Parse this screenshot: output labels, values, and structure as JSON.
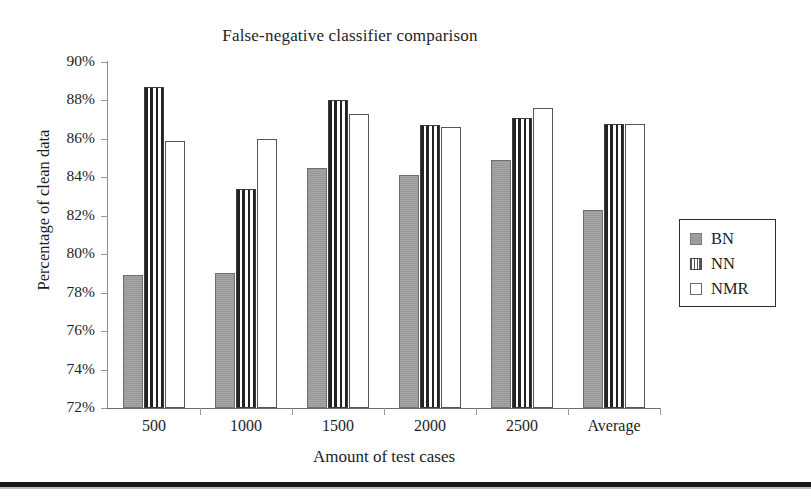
{
  "chart_data": {
    "type": "bar",
    "title": "False-negative classifier comparison",
    "xlabel": "Amount of test cases",
    "ylabel": "Percentage of clean data",
    "categories": [
      "500",
      "1000",
      "1500",
      "2000",
      "2500",
      "Average"
    ],
    "series": [
      {
        "name": "BN",
        "values": [
          78.9,
          79.0,
          84.5,
          84.1,
          84.9,
          82.3
        ]
      },
      {
        "name": "NN",
        "values": [
          88.7,
          83.4,
          88.0,
          86.7,
          87.1,
          86.8
        ]
      },
      {
        "name": "NMR",
        "values": [
          85.9,
          86.0,
          87.3,
          86.6,
          87.6,
          86.8
        ]
      }
    ],
    "ylim": [
      72,
      90
    ],
    "ytick_labels": [
      "90%",
      "88%",
      "86%",
      "84%",
      "82%",
      "80%",
      "78%",
      "76%",
      "74%",
      "72%"
    ],
    "ytick_values": [
      90,
      88,
      86,
      84,
      82,
      80,
      78,
      76,
      74,
      72
    ],
    "ytick_suffix": "%",
    "grid": false,
    "legend_position": "right",
    "legend_entries": [
      {
        "label": "BN",
        "swatch": "solid-gray"
      },
      {
        "label": "NN",
        "swatch": "vertical-stripes"
      },
      {
        "label": "NMR",
        "swatch": "empty-white"
      }
    ],
    "colors": {
      "bn_fill": "#9d9d9d",
      "nn_fill": "#ffffff",
      "nn_stripe": "#222222",
      "nmr_fill": "#ffffff",
      "axis": "#6d6d6d",
      "text": "#1d1d1d",
      "background": "#ffffff"
    }
  }
}
